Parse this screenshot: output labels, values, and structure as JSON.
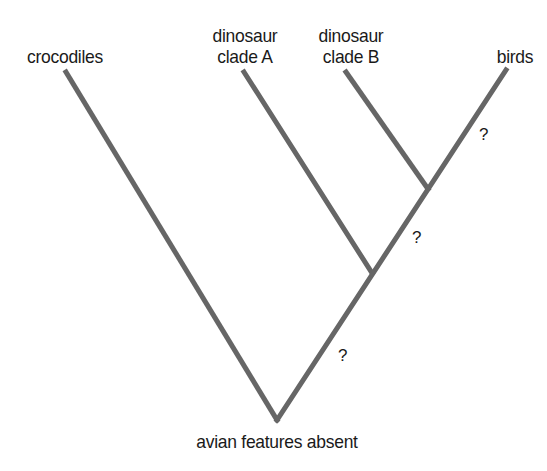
{
  "diagram": {
    "type": "cladogram",
    "line_color": "#666666",
    "text_color": "#1a1a1a",
    "taxa": [
      {
        "id": "crocodiles",
        "line1": "",
        "line2": "crocodiles"
      },
      {
        "id": "clade_a",
        "line1": "dinosaur",
        "line2": "clade A"
      },
      {
        "id": "clade_b",
        "line1": "dinosaur",
        "line2": "clade B"
      },
      {
        "id": "birds",
        "line1": "",
        "line2": "birds"
      }
    ],
    "root_label": "avian features absent",
    "unknown_markers": [
      {
        "id": "birds_branch",
        "text": "?"
      },
      {
        "id": "clade_b_node_branch",
        "text": "?"
      },
      {
        "id": "clade_a_node_branch",
        "text": "?"
      }
    ]
  }
}
